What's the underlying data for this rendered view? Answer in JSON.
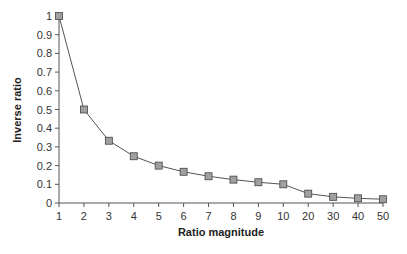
{
  "chart_data": {
    "type": "line",
    "title": "",
    "xlabel": "Ratio magnitude",
    "ylabel": "Inverse ratio",
    "categories": [
      "1",
      "2",
      "3",
      "4",
      "5",
      "6",
      "7",
      "8",
      "9",
      "10",
      "20",
      "30",
      "40",
      "50"
    ],
    "series": [
      {
        "name": "Inverse ratio",
        "values": [
          1,
          0.5,
          0.333,
          0.25,
          0.2,
          0.167,
          0.143,
          0.125,
          0.111,
          0.1,
          0.05,
          0.033,
          0.025,
          0.02
        ],
        "marker": "square",
        "marker_color": "#a0a0a0",
        "line_color": "#555555"
      }
    ],
    "ylim": [
      0,
      1
    ],
    "yticks": [
      "0",
      "0.1",
      "0.2",
      "0.3",
      "0.4",
      "0.5",
      "0.6",
      "0.7",
      "0.8",
      "0.9",
      "1"
    ],
    "grid": false,
    "legend": "none"
  }
}
